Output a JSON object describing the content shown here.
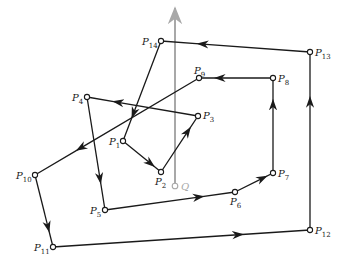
{
  "diagram": {
    "colors": {
      "edge": "#1a1a1a",
      "axis": "#a8a8a8",
      "background": "#ffffff"
    },
    "points": [
      {
        "id": "P1",
        "base": "P",
        "sub": "1",
        "x": 123,
        "y": 141,
        "lx": 109,
        "ly": 145
      },
      {
        "id": "P2",
        "base": "P",
        "sub": "2",
        "x": 161,
        "y": 172,
        "lx": 155,
        "ly": 185
      },
      {
        "id": "P3",
        "base": "P",
        "sub": "3",
        "x": 198,
        "y": 116,
        "lx": 203,
        "ly": 119
      },
      {
        "id": "P4",
        "base": "P",
        "sub": "4",
        "x": 87,
        "y": 97,
        "lx": 72,
        "ly": 101
      },
      {
        "id": "P5",
        "base": "P",
        "sub": "5",
        "x": 105,
        "y": 210,
        "lx": 90,
        "ly": 214
      },
      {
        "id": "P6",
        "base": "P",
        "sub": "6",
        "x": 235,
        "y": 192,
        "lx": 230,
        "ly": 205
      },
      {
        "id": "P7",
        "base": "P",
        "sub": "7",
        "x": 273,
        "y": 173,
        "lx": 278,
        "ly": 177
      },
      {
        "id": "P8",
        "base": "P",
        "sub": "8",
        "x": 273,
        "y": 78,
        "lx": 278,
        "ly": 82
      },
      {
        "id": "P9",
        "base": "P",
        "sub": "9",
        "x": 199,
        "y": 78,
        "lx": 194,
        "ly": 74
      },
      {
        "id": "P10",
        "base": "P",
        "sub": "10",
        "x": 35,
        "y": 175,
        "lx": 16,
        "ly": 179
      },
      {
        "id": "P11",
        "base": "P",
        "sub": "11",
        "x": 53,
        "y": 247,
        "lx": 34,
        "ly": 251
      },
      {
        "id": "P12",
        "base": "P",
        "sub": "12",
        "x": 310,
        "y": 230,
        "lx": 315,
        "ly": 234
      },
      {
        "id": "P13",
        "base": "P",
        "sub": "13",
        "x": 310,
        "y": 52,
        "lx": 315,
        "ly": 56
      },
      {
        "id": "P14",
        "base": "P",
        "sub": "14",
        "x": 161,
        "y": 41,
        "lx": 142,
        "ly": 45
      }
    ],
    "path_order": [
      "P1",
      "P2",
      "P3",
      "P4",
      "P5",
      "P6",
      "P7",
      "P8",
      "P9",
      "P10",
      "P11",
      "P12",
      "P13",
      "P14",
      "P1"
    ],
    "q_point": {
      "label": "Q",
      "x": 175,
      "y": 186,
      "lx": 181,
      "ly": 190
    },
    "ray": {
      "x": 175,
      "y_start": 186,
      "y_end": 8
    }
  }
}
